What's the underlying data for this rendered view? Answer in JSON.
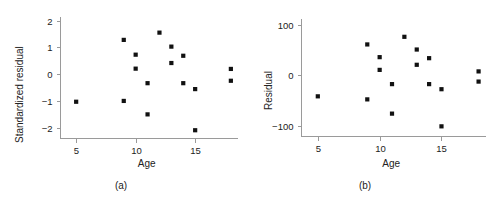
{
  "figure": {
    "background": "#ffffff",
    "marker_color": "#111111",
    "axis_color": "#9a9a9a",
    "text_color": "#222222"
  },
  "chart_data": [
    {
      "type": "scatter",
      "panel_label": "(a)",
      "title": "",
      "xlabel": "Age",
      "ylabel": "Standardized residual",
      "xlim": [
        3.6,
        18.6
      ],
      "ylim": [
        -2.35,
        2.15
      ],
      "xticks": [
        5,
        10,
        15
      ],
      "xtick_labels": [
        "5",
        "10",
        "15"
      ],
      "yticks": [
        -2,
        -1,
        0,
        1,
        2
      ],
      "ytick_labels": [
        "−2",
        "−1",
        "0",
        "1",
        "2"
      ],
      "grid": false,
      "legend": "none",
      "series": [
        {
          "name": "standardized residuals",
          "marker": "square",
          "points": [
            {
              "x": 5.0,
              "y": -1.02
            },
            {
              "x": 9.0,
              "y": 1.28
            },
            {
              "x": 9.0,
              "y": -0.99
            },
            {
              "x": 10.0,
              "y": 0.73
            },
            {
              "x": 10.0,
              "y": 0.21
            },
            {
              "x": 11.0,
              "y": -0.33
            },
            {
              "x": 11.0,
              "y": -1.49
            },
            {
              "x": 12.0,
              "y": 1.55
            },
            {
              "x": 13.0,
              "y": 1.03
            },
            {
              "x": 13.0,
              "y": 0.42
            },
            {
              "x": 14.0,
              "y": 0.69
            },
            {
              "x": 14.0,
              "y": -0.33
            },
            {
              "x": 15.0,
              "y": -0.55
            },
            {
              "x": 15.0,
              "y": -2.08
            },
            {
              "x": 18.0,
              "y": 0.2
            },
            {
              "x": 18.0,
              "y": -0.24
            }
          ]
        }
      ]
    },
    {
      "type": "scatter",
      "panel_label": "(b)",
      "title": "",
      "xlabel": "Age",
      "ylabel": "Residual",
      "xlim": [
        3.6,
        18.6
      ],
      "ylim": [
        -118,
        112
      ],
      "xticks": [
        5,
        10,
        15
      ],
      "xtick_labels": [
        "5",
        "10",
        "15"
      ],
      "yticks": [
        -100,
        0,
        100
      ],
      "ytick_labels": [
        "−100",
        "0",
        "100"
      ],
      "grid": false,
      "legend": "none",
      "series": [
        {
          "name": "residuals",
          "marker": "square",
          "points": [
            {
              "x": 5.0,
              "y": -41
            },
            {
              "x": 9.0,
              "y": 61
            },
            {
              "x": 9.0,
              "y": -47
            },
            {
              "x": 10.0,
              "y": 36
            },
            {
              "x": 10.0,
              "y": 11
            },
            {
              "x": 11.0,
              "y": -17
            },
            {
              "x": 11.0,
              "y": -75
            },
            {
              "x": 12.0,
              "y": 76
            },
            {
              "x": 13.0,
              "y": 51
            },
            {
              "x": 13.0,
              "y": 21
            },
            {
              "x": 14.0,
              "y": 34
            },
            {
              "x": 14.0,
              "y": -17
            },
            {
              "x": 15.0,
              "y": -27
            },
            {
              "x": 15.0,
              "y": -100
            },
            {
              "x": 18.0,
              "y": 8
            },
            {
              "x": 18.0,
              "y": -12
            }
          ]
        }
      ]
    }
  ]
}
